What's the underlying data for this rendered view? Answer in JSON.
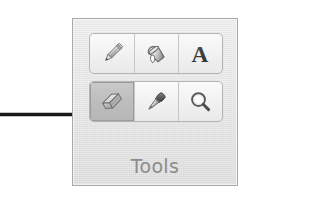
{
  "canvas": {
    "width": 258,
    "height": 201,
    "background_color": "#ffffff"
  },
  "annotation": {
    "name": "pointer-arrow",
    "description": "black arrow pointing right at the selected eraser tool",
    "color": "#1a1a1a",
    "direction": "right",
    "target": "eraser-tool-button"
  },
  "tools_group": {
    "label": "Tools",
    "label_color": "#8c8c8c",
    "panel_border_color": "#a9a9a9",
    "panel_background_color": "#eeeeee",
    "selected_tool": "eraser",
    "rows": [
      {
        "name": "tool-row-1",
        "buttons": [
          {
            "id": "pencil",
            "icon": "pencil-icon",
            "label": "Pencil",
            "selected": false
          },
          {
            "id": "fill",
            "icon": "paint-bucket-icon",
            "label": "Fill with color",
            "selected": false
          },
          {
            "id": "text",
            "icon": "text-a-icon",
            "label": "Text",
            "selected": false
          }
        ]
      },
      {
        "name": "tool-row-2",
        "buttons": [
          {
            "id": "eraser",
            "icon": "eraser-icon",
            "label": "Eraser",
            "selected": true
          },
          {
            "id": "color-picker",
            "icon": "eyedropper-icon",
            "label": "Color picker",
            "selected": false
          },
          {
            "id": "magnifier",
            "icon": "magnifier-icon",
            "label": "Magnifier",
            "selected": false
          }
        ]
      }
    ]
  }
}
